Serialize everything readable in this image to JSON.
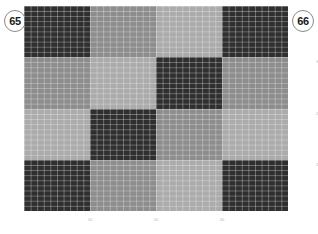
{
  "badges": {
    "left": "65",
    "right": "66"
  },
  "chart_data": {
    "type": "heatmap",
    "title": "",
    "xlabel": "",
    "ylabel": "",
    "xticks": [
      "10",
      "20",
      "30"
    ],
    "yticks": [
      "30",
      "20",
      "10"
    ],
    "xlim": [
      0,
      40
    ],
    "ylim": [
      0,
      40
    ],
    "grid": true,
    "legend": "none",
    "block_rows": 4,
    "block_cols": 4,
    "cells_per_block": 10,
    "colors": {
      "dark": "#2f2f2f",
      "medium": "#8d8d8d",
      "light": "#ababab",
      "background": "#ffffff",
      "gridline": "#ffffff",
      "badge_border": "#8a8a8a",
      "tick_text": "#b4b4b4"
    },
    "values": [
      [
        "dark",
        "medium",
        "light",
        "dark"
      ],
      [
        "medium",
        "light",
        "dark",
        "medium"
      ],
      [
        "light",
        "dark",
        "medium",
        "light"
      ],
      [
        "dark",
        "medium",
        "light",
        "dark"
      ]
    ]
  }
}
